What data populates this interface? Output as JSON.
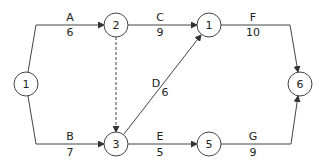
{
  "diagram": {
    "type": "activity-on-arrow network",
    "nodes": [
      {
        "id": "n_start",
        "label": "1",
        "x": 26,
        "y": 84
      },
      {
        "id": "n2",
        "label": "2",
        "x": 116,
        "y": 25
      },
      {
        "id": "n1top",
        "label": "1",
        "x": 209,
        "y": 25
      },
      {
        "id": "n3",
        "label": "3",
        "x": 116,
        "y": 144
      },
      {
        "id": "n5",
        "label": "5",
        "x": 209,
        "y": 144
      },
      {
        "id": "n6",
        "label": "6",
        "x": 300,
        "y": 84
      }
    ],
    "activities": [
      {
        "name": "A",
        "duration": "6",
        "from": "1",
        "to": "2",
        "name_x": 70,
        "name_y": 18,
        "dur_x": 70,
        "dur_y": 32
      },
      {
        "name": "C",
        "duration": "9",
        "from": "2",
        "to": "1",
        "name_x": 160,
        "name_y": 18,
        "dur_x": 160,
        "dur_y": 32
      },
      {
        "name": "F",
        "duration": "10",
        "from": "1",
        "to": "6",
        "name_x": 253,
        "name_y": 18,
        "dur_x": 253,
        "dur_y": 32
      },
      {
        "name": "B",
        "duration": "7",
        "from": "1",
        "to": "3",
        "name_x": 70,
        "name_y": 137,
        "dur_x": 70,
        "dur_y": 151
      },
      {
        "name": "E",
        "duration": "5",
        "from": "3",
        "to": "5",
        "name_x": 160,
        "name_y": 137,
        "dur_x": 160,
        "dur_y": 151
      },
      {
        "name": "G",
        "duration": "9",
        "from": "5",
        "to": "6",
        "name_x": 253,
        "name_y": 137,
        "dur_x": 253,
        "dur_y": 151
      },
      {
        "name": "D",
        "duration": "6",
        "from": "3",
        "to": "1",
        "name_x": 156,
        "name_y": 84,
        "dur_x": 164,
        "dur_y": 93
      }
    ],
    "dummy": {
      "from": "2",
      "to": "3",
      "style": "dashed"
    }
  }
}
